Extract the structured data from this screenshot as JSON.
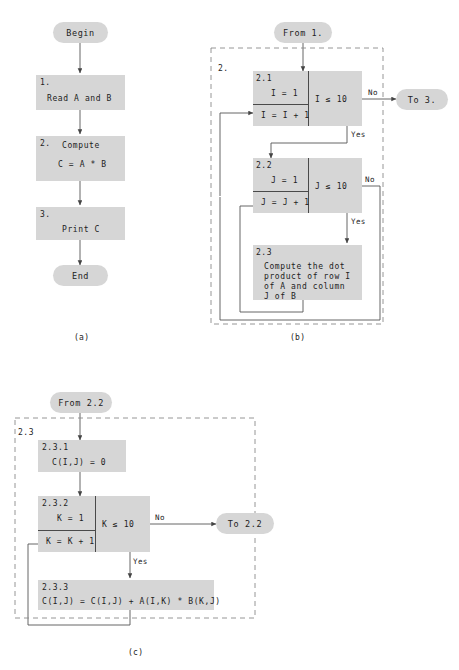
{
  "figure": {
    "type": "flowchart",
    "caption_a": "(a)",
    "caption_b": "(b)",
    "caption_c": "(c)"
  },
  "colors": {
    "box_fill": "#d6d6d6",
    "oval_fill": "#d6d6d6",
    "line": "#555555",
    "dashed": "#8a8a8a",
    "divider": "#4a4a4a",
    "text": "#1a1a1a",
    "background": "#ffffff"
  },
  "panel_a": {
    "begin": "Begin",
    "end": "End",
    "steps": [
      {
        "number": "1.",
        "text": "Read A and B"
      },
      {
        "number": "2.",
        "line1": "Compute",
        "line2": "C = A * B"
      },
      {
        "number": "3.",
        "text": "Print C"
      }
    ]
  },
  "panel_b": {
    "group_label": "2.",
    "from_connector": "From 1.",
    "to_connector": "To 3.",
    "step_2_1": {
      "number": "2.1",
      "init": "I = 1",
      "increment": "I = I + 1",
      "condition": "I ≤ 10",
      "no_label": "No",
      "yes_label": "Yes"
    },
    "step_2_2": {
      "number": "2.2",
      "init": "J = 1",
      "increment": "J = J + 1",
      "condition": "J ≤ 10",
      "no_label": "No",
      "yes_label": "Yes"
    },
    "step_2_3": {
      "number": "2.3",
      "line1": "Compute the dot",
      "line2": "product of row I",
      "line3": "of A and column",
      "line4": "J of B"
    }
  },
  "panel_c": {
    "group_label": "2.3",
    "from_connector": "From 2.2",
    "to_connector": "To 2.2",
    "step_2_3_1": {
      "number": "2.3.1",
      "text": "C(I,J) = 0"
    },
    "step_2_3_2": {
      "number": "2.3.2",
      "init": "K = 1",
      "increment": "K = K + 1",
      "condition": "K ≤ 10",
      "no_label": "No",
      "yes_label": "Yes"
    },
    "step_2_3_3": {
      "number": "2.3.3",
      "text": "C(I,J) = C(I,J) + A(I,K) * B(K,J)"
    }
  }
}
